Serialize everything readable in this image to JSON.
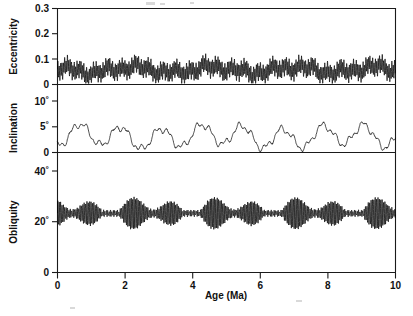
{
  "figure": {
    "background_color": "#ffffff",
    "line_color": "#000000",
    "axis_color": "#1a1a1a"
  },
  "axis": {
    "x_label": "Age (Ma)",
    "x_ticks": [
      "0",
      "2",
      "4",
      "6",
      "8",
      "10"
    ],
    "x_tick_values": [
      0,
      2,
      4,
      6,
      8,
      10
    ],
    "x_min": 0,
    "x_max": 10
  },
  "panels": [
    {
      "name": "eccentricity",
      "y_label": "Eccentricity",
      "y_ticks": [
        "0",
        "0.1",
        "0.2",
        "0.3"
      ],
      "y_tick_values": [
        0,
        0.1,
        0.2,
        0.3
      ],
      "y_min": 0,
      "y_max": 0.3
    },
    {
      "name": "inclination",
      "y_label": "Inclination",
      "y_ticks": [
        "0",
        "5˚",
        "10˚"
      ],
      "y_tick_values": [
        0,
        5,
        10
      ],
      "y_min": 0,
      "y_max": 10
    },
    {
      "name": "obliquity",
      "y_label": "Obliquity",
      "y_ticks": [
        "0",
        "20˚",
        "40˚"
      ],
      "y_tick_values": [
        0,
        20,
        40
      ],
      "y_min": 0,
      "y_max": 40
    }
  ],
  "chart_data": {
    "type": "line",
    "title": "",
    "subtitle": "",
    "xlabel": "Age (Ma)",
    "ylabel": "",
    "xlim": [
      0,
      10
    ],
    "grid": false,
    "legend": "none",
    "layout": "three stacked panels sharing one x axis",
    "series": [
      {
        "name": "Eccentricity",
        "ylabel": "Eccentricity",
        "ylim": [
          0,
          0.3
        ],
        "yticks": [
          0,
          0.1,
          0.2,
          0.3
        ],
        "ytick_labels": [
          "0",
          "0.1",
          "0.2",
          "0.3"
        ],
        "units": "dimensionless",
        "x_units": "Ma",
        "mean": 0.0575,
        "range": [
          0.005,
          0.115
        ],
        "description": "High-frequency ~100 kyr eccentricity cycles amplitude-modulated by a ~405 kyr envelope; envelope maxima near 2.1, 3.3, 5.2, 6.0, 8.5 and 10.0 Ma, minima near 0.1, 1.1, 2.9, 4.2, 5.0, 7.0, 9.1 Ma",
        "model": {
          "components": [
            {
              "amplitude": 0.0285,
              "period_Ma": 0.0405,
              "phase_deg": 0
            },
            {
              "amplitude": 0.0105,
              "period_Ma": 0.095,
              "phase_deg": 40
            },
            {
              "amplitude": 0.0115,
              "period_Ma": 0.405,
              "phase_deg": 200
            },
            {
              "amplitude": 0.0105,
              "period_Ma": 2.4,
              "phase_deg": 120
            },
            {
              "amplitude": 0.0075,
              "period_Ma": 1.0,
              "phase_deg": 300
            }
          ],
          "offset": 0.058
        },
        "envelope_peaks_Ma": [
          2.1,
          3.3,
          5.2,
          6.0,
          8.5,
          10.0
        ],
        "envelope_troughs_Ma": [
          0.1,
          1.1,
          2.9,
          4.2,
          5.0,
          7.0,
          9.1
        ]
      },
      {
        "name": "Inclination",
        "ylabel": "Inclination",
        "ylim": [
          0,
          10
        ],
        "yticks": [
          0,
          5,
          10
        ],
        "ytick_labels": [
          "0",
          "5˚",
          "10˚"
        ],
        "units": "degrees",
        "x_units": "Ma",
        "mean": 3.1,
        "range": [
          0.0,
          6.3
        ],
        "description": "Quasi-periodic ~1.2 Myr oscillation of the orbital inclination with superposed ~100 kyr roughness; peaks near 0.8, 2.1, 3.3, 4.7, 5.9, 7.2, 8.5, 9.7 Ma and near-zero minima at 0.05 and 4.0 Ma",
        "model": {
          "components": [
            {
              "amplitude": 1.95,
              "period_Ma": 1.2,
              "phase_deg": 250
            },
            {
              "amplitude": 0.55,
              "period_Ma": 0.41,
              "phase_deg": 70
            },
            {
              "amplitude": 0.35,
              "period_Ma": 0.18,
              "phase_deg": 150
            },
            {
              "amplitude": 0.5,
              "period_Ma": 3.9,
              "phase_deg": 20
            }
          ],
          "offset": 3.1
        },
        "peaks_Ma": [
          0.8,
          2.1,
          3.3,
          4.7,
          5.9,
          7.2,
          8.5,
          9.7
        ],
        "troughs_Ma": [
          0.05,
          1.4,
          2.7,
          4.0,
          5.3,
          6.7,
          7.9,
          9.1
        ]
      },
      {
        "name": "Obliquity",
        "ylabel": "Obliquity",
        "ylim": [
          0,
          40
        ],
        "yticks": [
          0,
          20,
          40
        ],
        "ytick_labels": [
          "0",
          "20˚",
          "40˚"
        ],
        "units": "degrees",
        "x_units": "Ma",
        "mean": 23.3,
        "range": [
          12.8,
          34.5
        ],
        "description": "Dense ~41 kyr obliquity cycles amplitude-modulated by a ~1.2 Myr beat; strongest amplitude bursts near 1.2, 2.3, 4.7, 5.8, 8.6 Ma, weakest near 0.3, 3.9, 6.7, 7.8 Ma",
        "model": {
          "carrier": {
            "period_Ma": 0.041,
            "phase_deg": 0
          },
          "amplitude_base": 2.6,
          "amplitude_modulation": [
            {
              "amplitude": 2.6,
              "period_Ma": 1.2,
              "phase_deg": 150
            },
            {
              "amplitude": 1.5,
              "period_Ma": 2.4,
              "phase_deg": 60
            }
          ],
          "offset": 23.3
        },
        "burst_maxima_Ma": [
          1.2,
          2.3,
          4.7,
          5.8,
          8.6
        ],
        "burst_minima_Ma": [
          0.3,
          3.9,
          6.7,
          7.8
        ]
      }
    ]
  }
}
